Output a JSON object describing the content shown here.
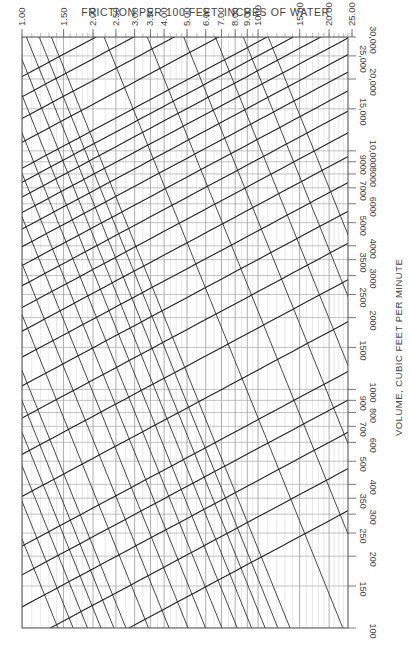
{
  "chart_data": {
    "type": "line",
    "title": "FRICTION PER 100 FEET, INCHES OF WATER",
    "xlabel": "FRICTION PER 100 FEET, INCHES OF WATER",
    "ylabel": "VOLUME, CUBIC FEET PER MINUTE",
    "x_scale": "log",
    "y_scale": "log",
    "xlim": [
      1.0,
      25.0
    ],
    "ylim": [
      100,
      30000
    ],
    "x_ticks": [
      "1.00",
      "1.50",
      "2.00",
      "2.50",
      "3.00",
      "3.50",
      "4.00",
      "5.00",
      "6.00",
      "7.00",
      "8.00",
      "9.00",
      "1000",
      "15.00",
      "20.00",
      "25.00"
    ],
    "x_tick_values": [
      1.0,
      1.5,
      2.0,
      2.5,
      3.0,
      3.5,
      4.0,
      5.0,
      6.0,
      7.0,
      8.0,
      9.0,
      10.0,
      15.0,
      20.0,
      25.0
    ],
    "y_ticks": [
      "100",
      "150",
      "200",
      "250",
      "300",
      "350",
      "400",
      "500",
      "600",
      "700",
      "800",
      "900",
      "1000",
      "1500",
      "2000",
      "2500",
      "3000",
      "3500",
      "4000",
      "5000",
      "6000",
      "7000",
      "8000",
      "9000",
      "10,000",
      "15,000",
      "20,000",
      "25,000",
      "30,000"
    ],
    "y_tick_values": [
      100,
      150,
      200,
      250,
      300,
      350,
      400,
      500,
      600,
      700,
      800,
      900,
      1000,
      1500,
      2000,
      2500,
      3000,
      3500,
      4000,
      5000,
      6000,
      7000,
      8000,
      9000,
      10000,
      15000,
      20000,
      25000,
      30000
    ],
    "series": [
      {
        "name": "Duct diameter (in.)",
        "kind": "diameter-lines",
        "labels": [
          "3",
          "3 1/2",
          "4",
          "4 1/2",
          "5",
          "6",
          "7",
          "8",
          "9",
          "10",
          "11",
          "12",
          "13",
          "14",
          "15",
          "16",
          "17",
          "18",
          "19",
          "20",
          "22",
          "24",
          "26",
          "28"
        ]
      },
      {
        "name": "Velocity (fpm)",
        "kind": "velocity-lines",
        "labels": [
          "1500",
          "1600",
          "1700",
          "1800",
          "1900",
          "2000",
          "2200",
          "2400",
          "2600",
          "2800",
          "3000",
          "3200",
          "3400",
          "3600",
          "3800",
          "4000",
          "5000",
          "6000",
          "7000",
          "8000",
          "9000",
          "10000"
        ]
      }
    ],
    "grid": true,
    "legend": "none (inline labels)"
  },
  "axes": {
    "top_title": "FRICTION PER 100 FEET, INCHES OF WATER",
    "right_title": "VOLUME, CUBIC FEET PER MINUTE"
  }
}
